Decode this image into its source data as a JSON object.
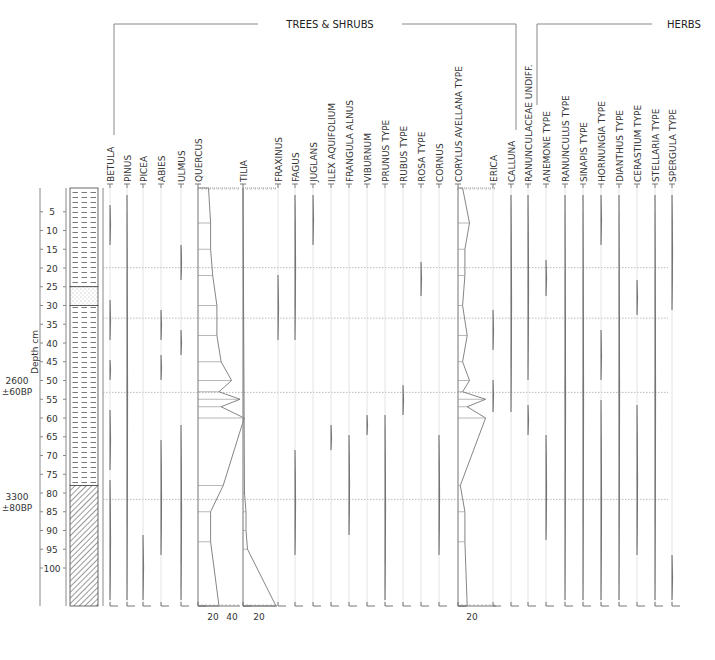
{
  "groups": {
    "trees": "TREES & SHRUBS",
    "herbs": "HERBS"
  },
  "axis": {
    "ylabel": "Depth cm",
    "ticks": [
      5,
      10,
      15,
      20,
      25,
      30,
      35,
      40,
      45,
      50,
      55,
      60,
      65,
      70,
      75,
      80,
      85,
      90,
      95,
      100
    ],
    "dates": [
      {
        "line1": "2600",
        "line2": "±60BP",
        "depth": 51.5
      },
      {
        "line1": "3300",
        "line2": "±80BP",
        "depth": 82.5
      }
    ]
  },
  "scale_labels": {
    "quercus": [
      "20",
      "40"
    ],
    "tilia": [
      "20"
    ],
    "corylus": [
      "20"
    ]
  },
  "chart_data": {
    "type": "area",
    "ylabel": "Depth cm",
    "ylim": [
      0,
      103
    ],
    "zone_boundaries_cm": [
      17.5,
      31.5,
      54.5,
      82.5
    ],
    "lithology": [
      {
        "from": 0,
        "to": 25,
        "type": "clay"
      },
      {
        "from": 25,
        "to": 30,
        "type": "sand"
      },
      {
        "from": 30,
        "to": 78,
        "type": "clay"
      },
      {
        "from": 78,
        "to": 103,
        "type": "peat-hatched"
      }
    ],
    "taxa": [
      {
        "name": "BETULA",
        "group": "trees"
      },
      {
        "name": "PINUS",
        "group": "trees"
      },
      {
        "name": "PICEA",
        "group": "trees"
      },
      {
        "name": "ABIES",
        "group": "trees"
      },
      {
        "name": "ULMUS",
        "group": "trees"
      },
      {
        "name": "QUERCUS",
        "group": "trees",
        "depths": [
          0,
          8,
          15,
          22,
          30,
          38,
          45,
          50,
          53,
          55,
          57,
          60,
          78,
          85,
          93,
          103
        ],
        "values": [
          5,
          6,
          6,
          7,
          9,
          9,
          11,
          16,
          10,
          20,
          11,
          22,
          12,
          6,
          6,
          10
        ]
      },
      {
        "name": "TILIA",
        "group": "trees",
        "depths": [
          0,
          80,
          85,
          90,
          95,
          103
        ],
        "values": [
          0,
          1,
          2,
          2,
          3,
          22
        ]
      },
      {
        "name": "FRAXINUS",
        "group": "trees"
      },
      {
        "name": "FAGUS",
        "group": "trees"
      },
      {
        "name": "JUGLANS",
        "group": "trees"
      },
      {
        "name": "ILEX AQUIFOLIUM",
        "group": "trees"
      },
      {
        "name": "FRANGULA ALNUS",
        "group": "trees"
      },
      {
        "name": "VIBURNUM",
        "group": "trees"
      },
      {
        "name": "PRUNUS TYPE",
        "group": "trees"
      },
      {
        "name": "RUBUS TYPE",
        "group": "trees"
      },
      {
        "name": "ROSA TYPE",
        "group": "trees"
      },
      {
        "name": "CORNUS",
        "group": "trees"
      },
      {
        "name": "CORYLUS AVELLANA TYPE",
        "group": "trees",
        "depths": [
          0,
          8,
          15,
          22,
          30,
          38,
          45,
          50,
          53,
          55,
          57,
          60,
          78,
          85,
          93,
          103
        ],
        "values": [
          2,
          5,
          3,
          3,
          2,
          4,
          2,
          5,
          2,
          12,
          4,
          12,
          1,
          3,
          3,
          4
        ]
      },
      {
        "name": "ERICA",
        "group": "trees"
      },
      {
        "name": "CALLUNA",
        "group": "trees"
      },
      {
        "name": "RANUNCULACEAE UNDIFF.",
        "group": "herbs"
      },
      {
        "name": "ANEMONE TYPE",
        "group": "herbs"
      },
      {
        "name": "RANUNCULUS TYPE",
        "group": "herbs"
      },
      {
        "name": "SINAPIS TYPE",
        "group": "herbs"
      },
      {
        "name": "HORNUNGIA TYPE",
        "group": "herbs"
      },
      {
        "name": "DIANTHUS TYPE",
        "group": "herbs"
      },
      {
        "name": "CERASTIUM TYPE",
        "group": "herbs"
      },
      {
        "name": "STELLARIA TYPE",
        "group": "herbs"
      },
      {
        "name": "SPERGULA TYPE",
        "group": "herbs"
      }
    ]
  }
}
